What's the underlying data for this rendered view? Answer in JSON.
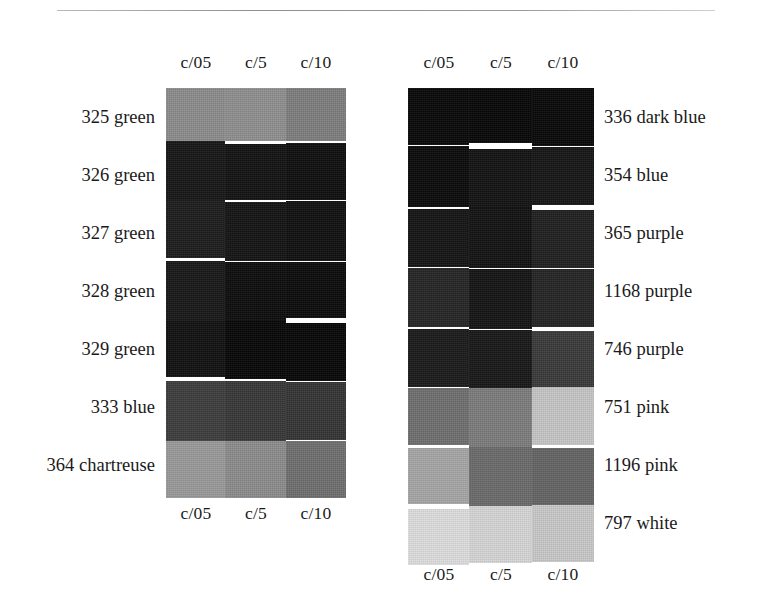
{
  "figure": {
    "rule_label": "horizontal-rule",
    "columns": [
      "c/05",
      "c/5",
      "c/10"
    ],
    "panels": [
      {
        "id": "left-panel",
        "header": [
          "c/05",
          "c/5",
          "c/10"
        ],
        "footer": [
          "c/05",
          "c/5",
          "c/10"
        ],
        "label_side": "left",
        "rows": [
          {
            "label": "325 green",
            "swatches": [
              "#8c8c8c",
              "#8f8f8f",
              "#7e7e7e"
            ]
          },
          {
            "label": "326 green",
            "swatches": [
              "#161616",
              "#121212",
              "#0e0e0e"
            ]
          },
          {
            "label": "327 green",
            "swatches": [
              "#1c1c1c",
              "#131313",
              "#0f0f0f"
            ]
          },
          {
            "label": "328 green",
            "swatches": [
              "#171717",
              "#0c0c0c",
              "#0a0a0a"
            ]
          },
          {
            "label": "329 green",
            "swatches": [
              "#101010",
              "#060606",
              "#060606"
            ]
          },
          {
            "label": "333 blue",
            "swatches": [
              "#3d3d3d",
              "#373737",
              "#343434"
            ]
          },
          {
            "label": "364 chartreuse",
            "swatches": [
              "#9a9a9a",
              "#8c8c8c",
              "#6f6f6f"
            ]
          }
        ]
      },
      {
        "id": "right-panel",
        "header": [
          "c/05",
          "c/5",
          "c/10"
        ],
        "footer": [
          "c/05",
          "c/5",
          "c/10"
        ],
        "label_side": "right",
        "rows": [
          {
            "label": "336 dark blue",
            "swatches": [
              "#070707",
              "#060606",
              "#070707"
            ]
          },
          {
            "label": "354 blue",
            "swatches": [
              "#090909",
              "#121212",
              "#151515"
            ]
          },
          {
            "label": "365 purple",
            "swatches": [
              "#141414",
              "#111111",
              "#1f1f1f"
            ]
          },
          {
            "label": "1168 purple",
            "swatches": [
              "#252525",
              "#131313",
              "#242424"
            ]
          },
          {
            "label": "746 purple",
            "swatches": [
              "#1a1a1a",
              "#171717",
              "#3a3a3a"
            ]
          },
          {
            "label": "751 pink",
            "swatches": [
              "#6f6f6f",
              "#7c7c7c",
              "#c6c6c6"
            ]
          },
          {
            "label": "1196 pink",
            "swatches": [
              "#a6a6a6",
              "#6b6b6b",
              "#646464"
            ]
          },
          {
            "label": "797 white",
            "swatches": [
              "#dedede",
              "#d6d6d6",
              "#c9c9c9"
            ]
          }
        ]
      }
    ]
  }
}
